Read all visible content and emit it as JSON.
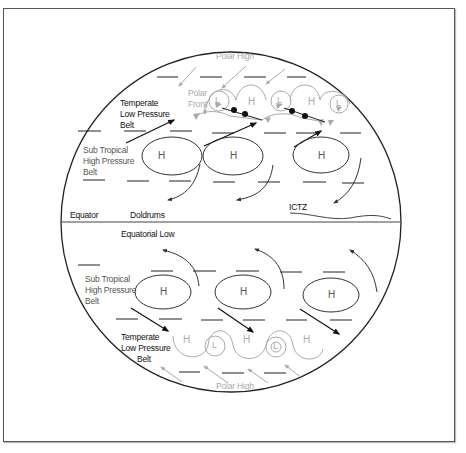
{
  "diagram": {
    "northern_hemisphere": {
      "polar_high": "Polar High",
      "polar_front": [
        "Polar",
        "Front"
      ],
      "temperate_belt": [
        "Temperate",
        "Low Pressure",
        "Belt"
      ],
      "subtropical_belt": [
        "Sub Tropical",
        "High Pressure",
        "Belt"
      ],
      "front_pressure_centers": [
        "L",
        "H",
        "L",
        "H",
        "L"
      ],
      "subtropical_highs": [
        "H",
        "H",
        "H"
      ]
    },
    "equator_zone": {
      "equator": "Equator",
      "doldrums": "Doldrums",
      "ictz": "ICTZ",
      "equatorial_low": "Equatorial Low"
    },
    "southern_hemisphere": {
      "subtropical_belt": [
        "Sub Tropical",
        "High Pressure",
        "Belt"
      ],
      "temperate_belt": [
        "Temperate",
        "Low Pressure",
        "Belt"
      ],
      "subtropical_highs": [
        "H",
        "H",
        "H"
      ],
      "wave_pressure_centers": [
        "H",
        "L",
        "H",
        "L",
        "H"
      ],
      "polar_high": "Polar High"
    },
    "colors": {
      "outline": "#222222",
      "primary_text": "#111111",
      "secondary_text": "#555555",
      "polar_gray": "#aaaaaa"
    }
  }
}
